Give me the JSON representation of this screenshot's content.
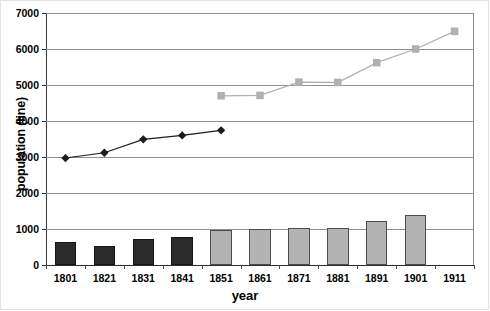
{
  "chart_data": {
    "type": "bar",
    "title": "",
    "xlabel": "year",
    "ylabel": "population (line)",
    "categories": [
      "1801",
      "1821",
      "1831",
      "1841",
      "1851",
      "1861",
      "1871",
      "1881",
      "1891",
      "1901",
      "1911"
    ],
    "ylim": [
      0,
      7000
    ],
    "ytick_labels": [
      "0",
      "1000",
      "2000",
      "3000",
      "4000",
      "5000",
      "6000",
      "7000"
    ],
    "ytick_values": [
      0,
      1000,
      2000,
      3000,
      4000,
      5000,
      6000,
      7000
    ],
    "grid": true,
    "legend": "none",
    "series": [
      {
        "name": "population (bars)",
        "type": "bar",
        "values": [
          640,
          530,
          730,
          780,
          980,
          1010,
          1040,
          1030,
          1210,
          1380,
          null
        ],
        "colors": [
          "#2b2b2b",
          "#2b2b2b",
          "#2b2b2b",
          "#2b2b2b",
          "#b3b3b3",
          "#b3b3b3",
          "#b3b3b3",
          "#b3b3b3",
          "#b3b3b3",
          "#b3b3b3",
          null
        ]
      },
      {
        "name": "population (dark diamond line)",
        "type": "line",
        "marker": "diamond",
        "color": "#1c1c1c",
        "values": [
          2970,
          3120,
          3490,
          3600,
          3740,
          null,
          null,
          null,
          null,
          null,
          null
        ]
      },
      {
        "name": "population (grey square line)",
        "type": "line",
        "marker": "square",
        "color": "#b0b0b0",
        "values": [
          null,
          null,
          null,
          null,
          4700,
          4710,
          5080,
          5070,
          5620,
          6000,
          6490
        ]
      }
    ]
  }
}
